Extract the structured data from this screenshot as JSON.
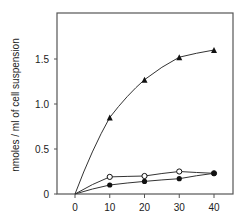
{
  "chart_data": {
    "type": "line",
    "title": "",
    "xlabel": "",
    "ylabel": "nmoles / ml of cell suspension",
    "x": [
      0,
      10,
      20,
      30,
      40
    ],
    "xticks": [
      "0",
      "10",
      "20",
      "30",
      "40"
    ],
    "yticks": [
      "0",
      "0.5",
      "1.0",
      "1.5"
    ],
    "xlim": [
      -5,
      45
    ],
    "ylim": [
      0,
      1.9
    ],
    "grid": false,
    "legend": null,
    "series": [
      {
        "name": "triangle",
        "marker": "filled-triangle",
        "values": [
          0,
          0.85,
          1.27,
          1.52,
          1.6
        ]
      },
      {
        "name": "open-circle",
        "marker": "open-circle",
        "values": [
          0,
          0.19,
          0.2,
          0.25,
          0.23
        ]
      },
      {
        "name": "filled-circle",
        "marker": "filled-circle",
        "values": [
          0,
          0.1,
          0.14,
          0.17,
          0.23
        ]
      }
    ]
  }
}
